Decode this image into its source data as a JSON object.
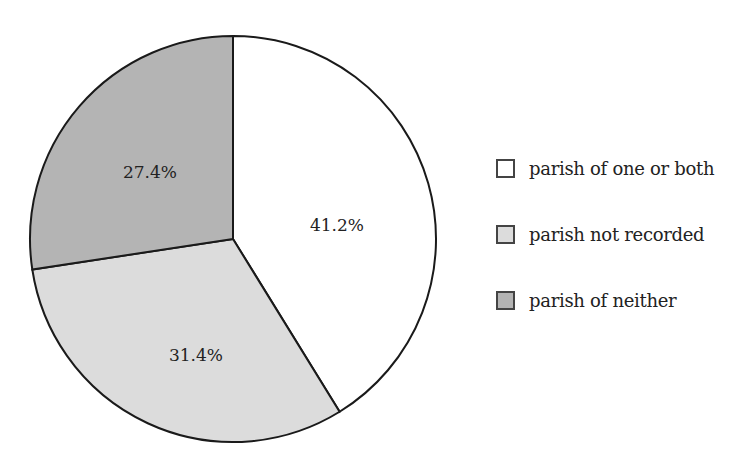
{
  "chart_data": {
    "type": "pie",
    "title": "",
    "categories": [
      "parish of one or both",
      "parish not recorded",
      "parish of neither"
    ],
    "values": [
      41.2,
      31.4,
      27.4
    ],
    "labels": [
      "41.2%",
      "31.4%",
      "27.4%"
    ],
    "colors": [
      "#ffffff",
      "#dcdcdc",
      "#b4b4b4"
    ],
    "start_angle": "12 o'clock, clockwise",
    "legend_position": "right"
  },
  "legend": {
    "items": [
      {
        "label": "parish of one or both",
        "color": "#ffffff"
      },
      {
        "label": "parish not recorded",
        "color": "#dcdcdc"
      },
      {
        "label": "parish of neither",
        "color": "#b4b4b4"
      }
    ]
  }
}
